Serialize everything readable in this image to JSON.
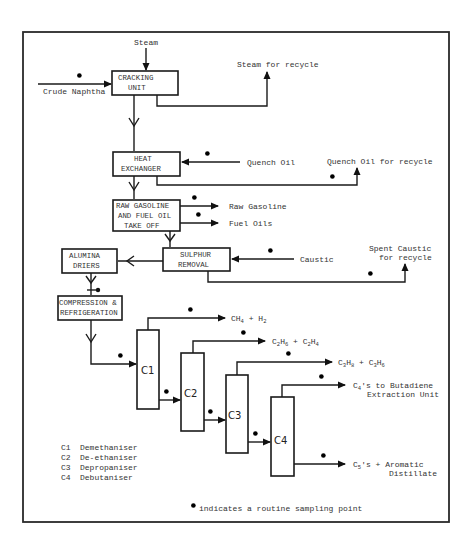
{
  "diagram": {
    "type": "process flow diagram",
    "units": {
      "cracking": [
        "CRACKING",
        "UNIT"
      ],
      "heat_exchanger": [
        "HEAT",
        "EXCHANGER"
      ],
      "raw_gasoline": [
        "RAW GASOLINE",
        "AND FUEL OIL",
        "TAKE OFF"
      ],
      "sulphur": [
        "SULPHUR",
        "REMOVAL"
      ],
      "alumina": [
        "ALUMINA",
        "DRIERS"
      ],
      "compression": [
        "COMPRESSION &",
        "REFRIGERATION"
      ]
    },
    "columns": [
      "C1",
      "C2",
      "C3",
      "C4"
    ],
    "streams": {
      "steam_in": "Steam",
      "crude_in": "Crude Naphtha",
      "steam_recycle": "Steam for recycle",
      "quench_in": "Quench Oil",
      "quench_recycle": "Quench Oil for recycle",
      "raw_gasoline_out": "Raw Gasoline",
      "fuel_oils_out": "Fuel Oils",
      "caustic_in": "Caustic",
      "spent_caustic_1": "Spent Caustic",
      "spent_caustic_2": "for recycle",
      "c1_out": {
        "a": "CH",
        "a_sub": "4",
        "b": " + H",
        "b_sub": "2"
      },
      "c2_out": {
        "a": "C",
        "a_sub": "2",
        "b": "H",
        "b_sub": "6",
        "c": " + C",
        "c_sub": "2",
        "d": "H",
        "d_sub": "4"
      },
      "c3_out": {
        "a": "C",
        "a_sub": "3",
        "b": "H",
        "b_sub": "8",
        "c": " + C",
        "c_sub": "3",
        "d": "H",
        "d_sub": "6"
      },
      "c4_top_1": {
        "a": "C",
        "a_sub": "4",
        "b": "'s to Butadiene"
      },
      "c4_top_2": "Extraction Unit",
      "c4_bottom_1": {
        "a": "C",
        "a_sub": "5",
        "b": "'s + Aromatic"
      },
      "c4_bottom_2": "Distillate"
    },
    "legend": [
      {
        "code": "C1",
        "name": "Demethaniser"
      },
      {
        "code": "C2",
        "name": "De-ethaniser"
      },
      {
        "code": "C3",
        "name": "Depropaniser"
      },
      {
        "code": "C4",
        "name": "Debutaniser"
      }
    ],
    "footnote": "indicates a routine sampling point"
  }
}
